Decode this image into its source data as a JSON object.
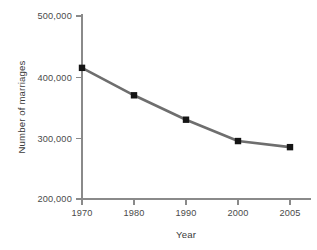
{
  "chart_data": {
    "type": "line",
    "title": "",
    "xlabel": "Year",
    "ylabel": "Number of marriages",
    "categories": [
      "1970",
      "1980",
      "1990",
      "2000",
      "2005"
    ],
    "values": [
      415000,
      370000,
      330000,
      295000,
      285000
    ],
    "series": [
      {
        "name": "Number of marriages",
        "values": [
          415000,
          370000,
          330000,
          295000,
          285000
        ]
      }
    ],
    "ylim": [
      200000,
      500000
    ],
    "ytick_values": [
      200000,
      300000,
      400000,
      500000
    ],
    "ytick_labels": [
      "200,000",
      "300,000",
      "400,000",
      "500,000"
    ],
    "xtick_labels": [
      "1970",
      "1980",
      "1990",
      "2000",
      "2005"
    ],
    "grid": false,
    "legend": false,
    "legend_position": "none",
    "marker": "square",
    "line_color": "#6e6e6e",
    "marker_color": "#151515",
    "axis_color": "#8a8a8a",
    "text_color": "#4a4a4a",
    "background_color": "#ffffff"
  },
  "axis": {
    "y_title": "Number of marriages",
    "x_title": "Year",
    "y_labels": {
      "t500": "500,000",
      "t400": "400,000",
      "t300": "300,000",
      "t200": "200,000"
    },
    "x_labels": {
      "c1970": "1970",
      "c1980": "1980",
      "c1990": "1990",
      "c2000": "2000",
      "c2005": "2005"
    }
  }
}
